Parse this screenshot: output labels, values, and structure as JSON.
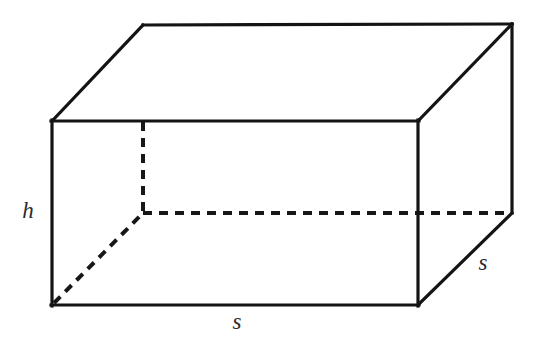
{
  "figure": {
    "background_color": "#ffffff",
    "stroke_color": "#141414",
    "hidden_stroke_color": "#171717",
    "label_color": "#2b2b2b",
    "labels": {
      "height": "h",
      "base_front": "s",
      "base_side": "s"
    },
    "label_positions": {
      "height": {
        "x": 28,
        "y": 213
      },
      "base_front": {
        "x": 237,
        "y": 324
      },
      "base_side": {
        "x": 483,
        "y": 265
      }
    },
    "vertices": {
      "front_top_left": {
        "x": 52,
        "y": 121
      },
      "front_top_right": {
        "x": 418,
        "y": 121
      },
      "front_bottom_left": {
        "x": 52,
        "y": 305
      },
      "front_bottom_right": {
        "x": 418,
        "y": 305
      },
      "back_top_left": {
        "x": 143,
        "y": 25
      },
      "back_top_right": {
        "x": 512,
        "y": 24
      },
      "back_bottom_left": {
        "x": 143,
        "y": 213
      },
      "back_bottom_right": {
        "x": 512,
        "y": 213
      }
    },
    "edges": {
      "visible": [
        {
          "name": "front-face-top",
          "from": "front_top_left",
          "to": "front_top_right"
        },
        {
          "name": "front-face-left",
          "from": "front_top_left",
          "to": "front_bottom_left"
        },
        {
          "name": "front-face-right",
          "from": "front_top_right",
          "to": "front_bottom_right"
        },
        {
          "name": "front-face-bottom",
          "from": "front_bottom_left",
          "to": "front_bottom_right"
        },
        {
          "name": "top-face-back",
          "from": "back_top_left",
          "to": "back_top_right"
        },
        {
          "name": "top-left-receding",
          "from": "front_top_left",
          "to": "back_top_left"
        },
        {
          "name": "top-right-receding",
          "from": "front_top_right",
          "to": "back_top_right"
        },
        {
          "name": "back-right-vertical",
          "from": "back_top_right",
          "to": "back_bottom_right"
        },
        {
          "name": "bottom-right-receding",
          "from": "front_bottom_right",
          "to": "back_bottom_right"
        }
      ],
      "hidden": [
        {
          "name": "back-left-vertical",
          "from": "back_top_left",
          "to": "back_bottom_left"
        },
        {
          "name": "bottom-face-back",
          "from": "back_bottom_left",
          "to": "back_bottom_right"
        },
        {
          "name": "bottom-left-receding",
          "from": "front_bottom_left",
          "to": "back_bottom_left"
        }
      ]
    }
  }
}
